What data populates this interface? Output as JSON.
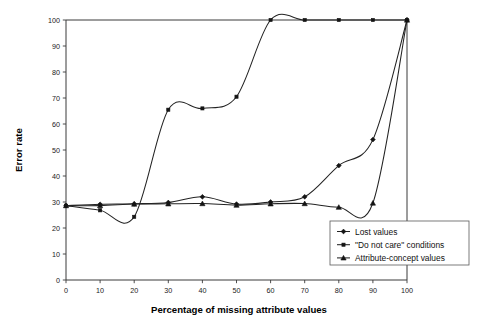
{
  "chart_data": {
    "type": "line",
    "title": "",
    "xlabel": "Percentage of missing attribute values",
    "ylabel": "Error rate",
    "xlim": [
      0,
      100
    ],
    "ylim": [
      0,
      100
    ],
    "xticks": [
      0,
      10,
      20,
      30,
      40,
      50,
      60,
      70,
      80,
      90,
      100
    ],
    "yticks": [
      0,
      10,
      20,
      30,
      40,
      50,
      60,
      70,
      80,
      90,
      100
    ],
    "xtick_labels": [
      "0",
      "10",
      "20",
      "30",
      "40",
      "50",
      "60",
      "70",
      "80",
      "90",
      "100"
    ],
    "ytick_labels": [
      "0",
      "10",
      "20",
      "30",
      "40",
      "50",
      "60",
      "70",
      "80",
      "90",
      "100"
    ],
    "grid": false,
    "legend_position": "lower right",
    "x": [
      0,
      10,
      20,
      30,
      40,
      50,
      60,
      70,
      80,
      90,
      100
    ],
    "series": [
      {
        "name": "Lost values",
        "marker": "diamond",
        "values": [
          28.6,
          29.1,
          29.3,
          29.8,
          32.0,
          29.2,
          30.0,
          32.0,
          44.0,
          54.0,
          100.0
        ]
      },
      {
        "name": "\"Do not care\" conditions",
        "marker": "square",
        "values": [
          28.6,
          26.8,
          24.3,
          65.5,
          66.0,
          70.5,
          100.0,
          100.0,
          100.0,
          100.0,
          100.0
        ]
      },
      {
        "name": "Attribute-concept values",
        "marker": "triangle",
        "values": [
          28.6,
          28.6,
          29.2,
          29.3,
          29.4,
          28.8,
          29.3,
          29.4,
          28.0,
          29.6,
          100.0
        ]
      }
    ]
  },
  "legend": {
    "entries": [
      {
        "label": "Lost values",
        "marker": "diamond"
      },
      {
        "label": "\"Do not care\" conditions",
        "marker": "square"
      },
      {
        "label": "Attribute-concept values",
        "marker": "triangle"
      }
    ]
  },
  "axes": {
    "x_title": "Percentage of missing attribute values",
    "y_title": "Error rate"
  },
  "colors": {
    "line": "#232323",
    "frame": "#3a3a3a",
    "background": "#ffffff",
    "text": "#111111"
  }
}
